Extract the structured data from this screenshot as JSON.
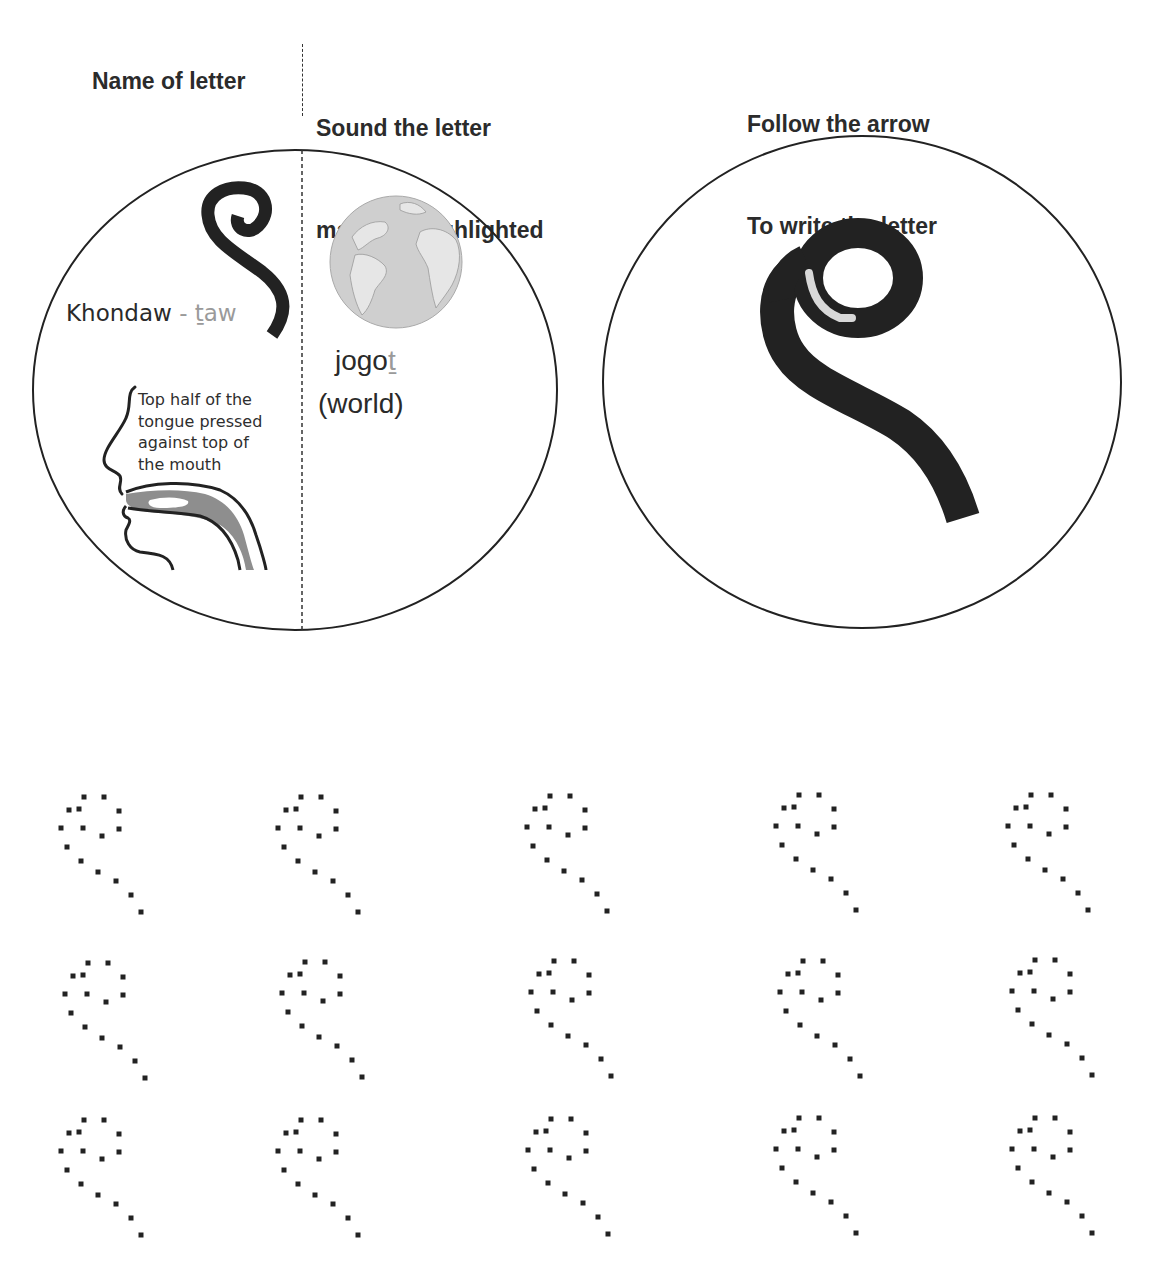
{
  "headers": {
    "name_of_letter": "Name of letter",
    "sound_line1": "Sound the letter",
    "sound_line2": "makes is highlighted",
    "follow_line1": "Follow the arrow",
    "follow_line2": "To write the letter"
  },
  "letter_panel": {
    "letter_name": "Khondaw",
    "separator": " - ",
    "sound_highlight": "ṯaw",
    "tongue_note": "Top half of the\ntongue pressed\nagainst top of\nthe mouth",
    "example_word_prefix": "jogo",
    "example_word_highlight": "ṯ",
    "example_gloss": "(world)",
    "example_image": "globe-icon"
  },
  "writing_panel": {
    "glyph": "letter-stroke-guide",
    "arrow_color": "#d8d8d8"
  },
  "colors": {
    "ink": "#222222",
    "highlight_text": "#9a9a9a",
    "tongue_fill": "#8e8e8e",
    "globe_ocean": "#cfcfcf",
    "globe_land": "#e6e6e6"
  },
  "tracing_grid": {
    "rows": 3,
    "columns": 5,
    "item": "dotted-letter-tracing"
  }
}
